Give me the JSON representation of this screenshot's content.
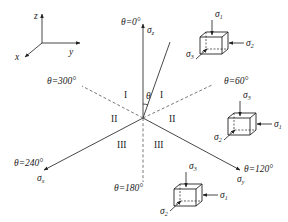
{
  "figure": {
    "coordinate_triad": {
      "z_label": "z",
      "y_label": "y",
      "x_label": "x"
    },
    "axes": {
      "sigma_z": {
        "label": "σ",
        "sub": "z",
        "angle_label": "θ=0°"
      },
      "sigma_x": {
        "label": "σ",
        "sub": "x",
        "angle_label": "θ=240°"
      },
      "sigma_y": {
        "label": "σ",
        "sub": "y",
        "angle_label": "θ=120°"
      }
    },
    "dashed_lines": {
      "d300": {
        "angle_label": "θ=300°"
      },
      "d60": {
        "angle_label": "θ=60°"
      },
      "d180": {
        "angle_label": "θ=180°"
      }
    },
    "theta_symbol": "θ",
    "regions": {
      "I_left": "I",
      "I_right": "I",
      "II_left": "II",
      "II_right": "II",
      "III_left": "III",
      "III_right": "III"
    },
    "cubes": {
      "top": {
        "top_load": "σ",
        "top_sub": "1",
        "side_load": "σ",
        "side_sub": "2",
        "front_load": "σ",
        "front_sub": "3"
      },
      "middle": {
        "top_load": "σ",
        "top_sub": "3",
        "side_load": "σ",
        "side_sub": "1",
        "front_load": "σ",
        "front_sub": "2"
      },
      "bottom": {
        "top_load": "σ",
        "top_sub": "3",
        "side_load": "σ",
        "side_sub": "1",
        "front_load": "σ",
        "front_sub": "2"
      }
    }
  }
}
